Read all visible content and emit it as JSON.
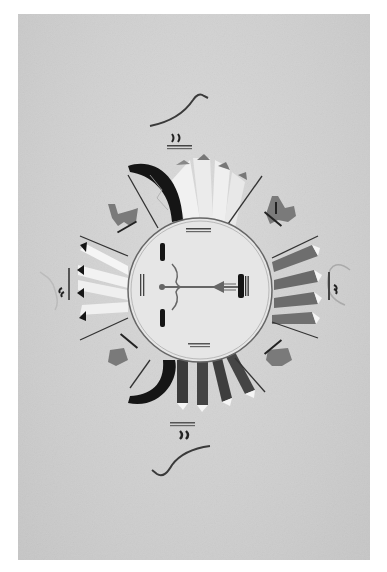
{
  "image": {
    "description": "Black and white photograph of a sandpainting with a central sun disk, four radiating groups of feathered rays, dark crescent wings, four horned animal figures at the diagonals, and bird figures above and below",
    "colors": {
      "background": "#d2d2d2",
      "sand_light": "#ececec",
      "dark": "#1a1a1a",
      "mid_gray": "#7a7a7a",
      "rays_gray": "#8c8c8c"
    },
    "elements": {
      "center_disk": "sun-disk",
      "arrow": "arrow-figure",
      "top_bird": "bird-figure-top",
      "bottom_bird": "bird-figure-bottom",
      "left_bird": "bird-figure-left",
      "right_bird": "bird-figure-right",
      "animals": [
        "animal-top-left",
        "animal-top-right",
        "animal-bottom-left",
        "animal-bottom-right"
      ],
      "crescents": [
        "crescent-top-left",
        "crescent-bottom-left"
      ]
    }
  }
}
